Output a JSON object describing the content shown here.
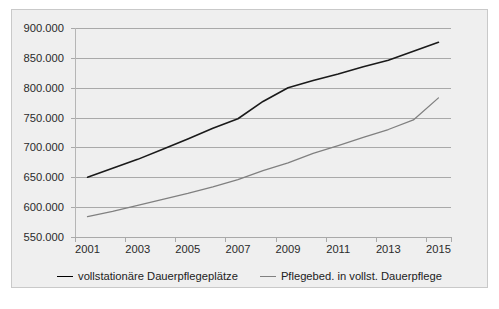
{
  "chart_data": {
    "type": "line",
    "title": "",
    "subtitle": "",
    "xlabel": "",
    "ylabel": "",
    "grid": true,
    "legend_position": "bottom",
    "categories": [
      "2001",
      "2002",
      "2003",
      "2004",
      "2005",
      "2006",
      "2007",
      "2008",
      "2009",
      "2010",
      "2011",
      "2012",
      "2013",
      "2014",
      "2015"
    ],
    "tick_labels_x": [
      "2001",
      "2003",
      "2005",
      "2007",
      "2009",
      "2011",
      "2013",
      "2015"
    ],
    "tick_labels_y": [
      "550.000",
      "600.000",
      "650.000",
      "700.000",
      "750.000",
      "800.000",
      "850.000",
      "900.000"
    ],
    "ylim": [
      550000,
      900000
    ],
    "yticks": [
      550000,
      600000,
      650000,
      700000,
      750000,
      800000,
      850000,
      900000
    ],
    "series": [
      {
        "name": "vollstationäre Dauerpflegeplätze",
        "color": "#1a1a1a",
        "values": [
          650000,
          665000,
          680000,
          697000,
          714000,
          732000,
          748000,
          777000,
          800000,
          812000,
          823000,
          835000,
          846000,
          861000,
          876000
        ]
      },
      {
        "name": "Pflegebed. in vollst. Dauerpflege",
        "color": "#808080",
        "values": [
          584000,
          593000,
          603000,
          613000,
          623000,
          634000,
          646000,
          661000,
          674000,
          690000,
          703000,
          717000,
          730000,
          746000,
          783000
        ]
      }
    ]
  },
  "legend": {
    "items": [
      {
        "label": "vollstationäre Dauerpflegeplätze"
      },
      {
        "label": "Pflegebed. in vollst. Dauerpflege"
      }
    ]
  },
  "caption": {
    "text": ""
  }
}
